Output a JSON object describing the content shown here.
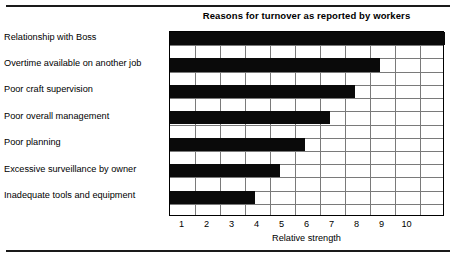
{
  "chart_data": {
    "type": "bar",
    "orientation": "horizontal",
    "title": "Reasons for turnover as reported by workers",
    "xlabel": "Relative strength",
    "ylabel": "",
    "xlim": [
      0,
      11
    ],
    "xticks": [
      1,
      2,
      3,
      4,
      5,
      6,
      7,
      8,
      9,
      10
    ],
    "xtick_labels": [
      "1",
      "2",
      "3",
      "4",
      "5",
      "6",
      "7",
      "8",
      "9",
      "10"
    ],
    "grid": true,
    "legend": false,
    "bar_color": "#0a0a0a",
    "grid_color": "#7a7a7a",
    "frame_color": "#000000",
    "categories": [
      "Relationship with Boss",
      "Overtime available on another job",
      "Poor craft supervision",
      "Poor overall management",
      "Poor planning",
      "Excessive surveillance by owner",
      "Inadequate tools and equipment"
    ],
    "values": [
      11.0,
      8.4,
      7.4,
      6.4,
      5.4,
      4.4,
      3.4
    ]
  }
}
